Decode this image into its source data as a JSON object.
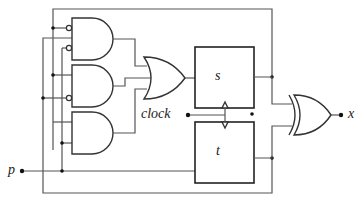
{
  "diagram": {
    "type": "sequential logic circuit",
    "inputs": [
      {
        "id": "p",
        "label": "p"
      },
      {
        "id": "clock",
        "label": "clock"
      }
    ],
    "outputs": [
      {
        "id": "x",
        "label": "x"
      }
    ],
    "flip_flops": [
      {
        "id": "s",
        "label": "s"
      },
      {
        "id": "t",
        "label": "t"
      }
    ],
    "gates": [
      {
        "id": "and1",
        "type": "AND",
        "inverted_inputs": 2
      },
      {
        "id": "and2",
        "type": "AND",
        "inverted_inputs": 1
      },
      {
        "id": "and3",
        "type": "AND",
        "inverted_inputs": 0
      },
      {
        "id": "or1",
        "type": "OR"
      },
      {
        "id": "xor1",
        "type": "XOR"
      }
    ],
    "colors": {
      "wire": "#555555",
      "stroke": "#333333",
      "background": "#ffffff"
    }
  }
}
